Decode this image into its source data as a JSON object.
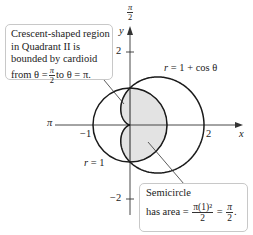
{
  "figure": {
    "type": "polar-area-diagram",
    "axes": {
      "x_label": "x",
      "y_label": "y",
      "pi_label": "π",
      "pi_over_2_label": {
        "num": "π",
        "den": "2"
      },
      "ticks": {
        "x_pos": "2",
        "x_neg": "−1",
        "y_pos": "2",
        "y_neg": "−2"
      }
    },
    "curves": [
      {
        "name": "cardioid",
        "label_lhs": "r",
        "label_rhs": "= 1 + cos θ"
      },
      {
        "name": "unit-circle",
        "label_lhs": "r",
        "label_rhs": "= 1"
      }
    ],
    "colors": {
      "curve": "#1a1a1a",
      "shade": "#e3e3e3",
      "shade_edge": "#9a9a9a",
      "callout_border": "#c8c8c8"
    }
  },
  "callouts": {
    "crescent": {
      "line1": "Crescent-shaped region",
      "line2": "in Quadrant II is",
      "line3": "bounded by cardioid",
      "line4_prefix": "from θ =",
      "frac_num": "π",
      "frac_den": "2",
      "line4_mid": "to θ = π."
    },
    "semicircle": {
      "line1": "Semicircle",
      "line2_prefix": "has area =",
      "frac1_num": "π(1)²",
      "frac1_den": "2",
      "equals": "=",
      "frac2_num": "π",
      "frac2_den": "2",
      "suffix": "."
    }
  }
}
